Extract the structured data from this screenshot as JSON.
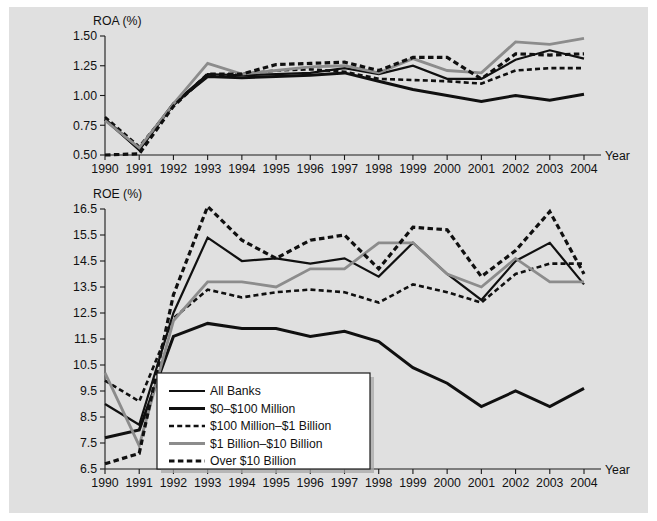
{
  "figure": {
    "background_color": "#e0e0e0",
    "page_color": "#ffffff"
  },
  "series_styles": [
    {
      "key": "all_banks",
      "label": "All Banks",
      "color": "#101010",
      "width": 2.2,
      "dash": "none"
    },
    {
      "key": "under_100m",
      "label": "$0–$100 Million",
      "color": "#101010",
      "width": 3.0,
      "dash": "none"
    },
    {
      "key": "100m_1b",
      "label": "$100 Million–$1 Billion",
      "color": "#101010",
      "width": 2.6,
      "dash": "5,3.2"
    },
    {
      "key": "1b_10b",
      "label": "$1 Billion–$10 Billion",
      "color": "#8c8c8c",
      "width": 2.8,
      "dash": "none"
    },
    {
      "key": "over_10b",
      "label": "Over $10 Billion",
      "color": "#101010",
      "width": 3.2,
      "dash": "5.5,3.4"
    }
  ],
  "legend": {
    "position": "lower-left-inside-roe",
    "entries": [
      "All Banks",
      "$0–$100 Million",
      "$100 Million–$1 Billion",
      "$1 Billion–$10 Billion",
      "Over $10 Billion"
    ]
  },
  "chart_data": [
    {
      "id": "roa",
      "type": "line",
      "title": "ROA (%)",
      "ylabel": "ROA (%)",
      "xlabel": "Year",
      "grid": false,
      "legend_position": "none",
      "x": [
        1990,
        1991,
        1992,
        1993,
        1994,
        1995,
        1996,
        1997,
        1998,
        1999,
        2000,
        2001,
        2002,
        2003,
        2004
      ],
      "xticklabels": [
        "1990",
        "1991",
        "1992",
        "1993",
        "1994",
        "1995",
        "1996",
        "1997",
        "1998",
        "1999",
        "2000",
        "2001",
        "2002",
        "2003",
        "2004"
      ],
      "ylim": [
        0.5,
        1.5
      ],
      "yticks": [
        0.5,
        0.75,
        1.0,
        1.25,
        1.5
      ],
      "yticklabels": [
        "0.50",
        "0.75",
        "1.00",
        "1.25",
        "1.50"
      ],
      "series": [
        {
          "name": "All Banks",
          "key": "all_banks",
          "values": [
            0.8,
            0.54,
            0.93,
            1.18,
            1.17,
            1.18,
            1.19,
            1.23,
            1.18,
            1.25,
            1.14,
            1.14,
            1.3,
            1.38,
            1.31
          ]
        },
        {
          "name": "$0–$100 Million",
          "key": "under_100m",
          "values": [
            0.8,
            0.55,
            0.93,
            1.16,
            1.15,
            1.16,
            1.17,
            1.19,
            1.12,
            1.05,
            1.0,
            0.95,
            1.0,
            0.96,
            1.01
          ]
        },
        {
          "name": "$100 Million–$1 Billion",
          "key": "100m_1b",
          "values": [
            0.82,
            0.57,
            0.92,
            1.17,
            1.18,
            1.21,
            1.22,
            1.2,
            1.14,
            1.13,
            1.12,
            1.1,
            1.21,
            1.23,
            1.23
          ]
        },
        {
          "name": "$1 Billion–$10 Billion",
          "key": "1b_10b",
          "values": [
            0.79,
            0.56,
            0.93,
            1.27,
            1.18,
            1.21,
            1.24,
            1.25,
            1.19,
            1.31,
            1.21,
            1.19,
            1.45,
            1.43,
            1.48
          ]
        },
        {
          "name": "Over $10 Billion",
          "key": "over_10b",
          "values": [
            0.5,
            0.51,
            0.91,
            1.18,
            1.18,
            1.26,
            1.27,
            1.28,
            1.21,
            1.32,
            1.32,
            1.14,
            1.35,
            1.34,
            1.35
          ]
        }
      ]
    },
    {
      "id": "roe",
      "type": "line",
      "title": "ROE (%)",
      "ylabel": "ROE (%)",
      "xlabel": "Year",
      "grid": false,
      "legend_position": "lower-left",
      "x": [
        1990,
        1991,
        1992,
        1993,
        1994,
        1995,
        1996,
        1997,
        1998,
        1999,
        2000,
        2001,
        2002,
        2003,
        2004
      ],
      "xticklabels": [
        "1990",
        "1991",
        "1992",
        "1993",
        "1994",
        "1995",
        "1996",
        "1997",
        "1998",
        "1999",
        "2000",
        "2001",
        "2002",
        "2003",
        "2004"
      ],
      "ylim": [
        6.5,
        16.5
      ],
      "yticks": [
        6.5,
        7.5,
        8.5,
        9.5,
        10.5,
        11.5,
        12.5,
        13.5,
        14.5,
        15.5,
        16.5
      ],
      "yticklabels": [
        "6.5",
        "7.5",
        "8.5",
        "9.5",
        "10.5",
        "11.5",
        "12.5",
        "13.5",
        "14.5",
        "15.5",
        "16.5"
      ],
      "series": [
        {
          "name": "All Banks",
          "key": "all_banks",
          "values": [
            9.0,
            8.2,
            12.5,
            15.4,
            14.5,
            14.6,
            14.4,
            14.6,
            13.9,
            15.2,
            14.0,
            13.0,
            14.5,
            15.2,
            13.6
          ]
        },
        {
          "name": "$0–$100 Million",
          "key": "under_100m",
          "values": [
            7.7,
            8.0,
            11.6,
            12.1,
            11.9,
            11.9,
            11.6,
            11.8,
            11.4,
            10.4,
            9.8,
            8.9,
            9.5,
            8.9,
            9.6
          ]
        },
        {
          "name": "$100 Million–$1 Billion",
          "key": "100m_1b",
          "values": [
            9.9,
            9.1,
            12.3,
            13.4,
            13.1,
            13.3,
            13.4,
            13.3,
            12.9,
            13.6,
            13.3,
            12.9,
            14.0,
            14.4,
            14.4
          ]
        },
        {
          "name": "$1 Billion–$10 Billion",
          "key": "1b_10b",
          "values": [
            10.2,
            7.4,
            12.2,
            13.7,
            13.7,
            13.5,
            14.2,
            14.2,
            15.2,
            15.2,
            14.0,
            13.5,
            14.6,
            13.7,
            13.7
          ]
        },
        {
          "name": "Over $10 Billion",
          "key": "over_10b",
          "values": [
            6.7,
            7.1,
            13.2,
            16.6,
            15.3,
            14.6,
            15.3,
            15.5,
            14.2,
            15.8,
            15.7,
            13.9,
            14.9,
            16.4,
            14.0
          ]
        }
      ]
    }
  ]
}
